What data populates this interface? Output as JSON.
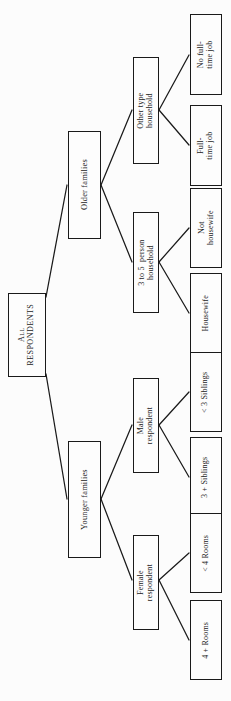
{
  "diagram": {
    "type": "tree",
    "orientation": "rotated-90-ccw",
    "background_color": "#fcfcfc",
    "box_border_color": "#1a1a1a",
    "edge_color": "#1a1a1a",
    "root": {
      "id": "all-respondents",
      "label": "All\nRESPONDENTS",
      "level": 0
    },
    "nodes": [
      {
        "id": "older-families",
        "label": "Older families",
        "level": 1,
        "parent": "all-respondents"
      },
      {
        "id": "younger-families",
        "label": "Younger families",
        "level": 1,
        "parent": "all-respondents"
      },
      {
        "id": "other-type-household",
        "label": "Other type\nhousehold",
        "level": 2,
        "parent": "older-families"
      },
      {
        "id": "three-to-five-person-household",
        "label": "3 to 5  person\nhousehold",
        "level": 2,
        "parent": "older-families"
      },
      {
        "id": "male-respondent",
        "label": "Male\nrespondent",
        "level": 2,
        "parent": "younger-families"
      },
      {
        "id": "female-respondent",
        "label": "Female\nrespondent",
        "level": 2,
        "parent": "younger-families"
      },
      {
        "id": "no-full-time-job",
        "label": "No full-\ntime job",
        "level": 3,
        "parent": "other-type-household"
      },
      {
        "id": "full-time-job",
        "label": "Full-\ntime job",
        "level": 3,
        "parent": "other-type-household"
      },
      {
        "id": "not-housewife",
        "label": "Not\nhousewife",
        "level": 3,
        "parent": "three-to-five-person-household"
      },
      {
        "id": "housewife",
        "label": "Housewife",
        "level": 3,
        "parent": "three-to-five-person-household"
      },
      {
        "id": "less-than-3-siblings",
        "label": "< 3 Siblings",
        "level": 3,
        "parent": "male-respondent"
      },
      {
        "id": "three-plus-siblings",
        "label": "3 + Siblings",
        "level": 3,
        "parent": "male-respondent"
      },
      {
        "id": "less-than-4-rooms",
        "label": "< 4 Rooms",
        "level": 3,
        "parent": "female-respondent"
      },
      {
        "id": "four-plus-rooms",
        "label": "4 + Rooms",
        "level": 3,
        "parent": "female-respondent"
      }
    ]
  }
}
